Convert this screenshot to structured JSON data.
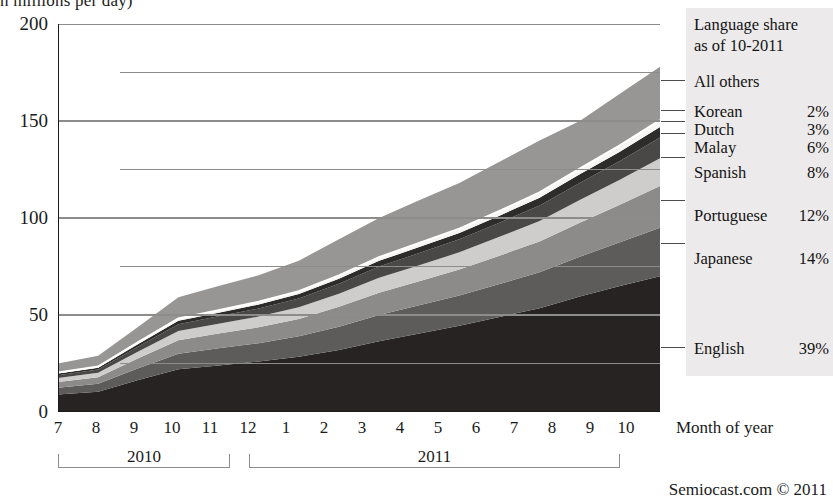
{
  "chart_data": {
    "type": "area",
    "title": "n millions per day)",
    "xlabel": "Month of year",
    "ylabel": "",
    "ylim": [
      0,
      200
    ],
    "yticks": [
      0,
      50,
      100,
      150,
      200
    ],
    "yticks_minor": [
      25,
      75,
      125,
      175
    ],
    "grid": true,
    "legend_position": "right",
    "stacked": true,
    "x": [
      "7",
      "8",
      "9",
      "10",
      "11",
      "12",
      "1",
      "2",
      "3",
      "4",
      "5",
      "6",
      "7",
      "8",
      "9",
      "10"
    ],
    "x_groups": [
      {
        "year": "2010",
        "start_index": 0,
        "end_index": 5
      },
      {
        "year": "2011",
        "start_index": 6,
        "end_index": 15
      }
    ],
    "series": [
      {
        "name": "English",
        "share": "39%",
        "color": "#262322",
        "values": [
          9.0,
          10.5,
          16.5,
          22.0,
          24.0,
          26.0,
          28.5,
          32.0,
          36.5,
          40.5,
          44.5,
          49.0,
          53.5,
          59.5,
          65.0,
          70.0
        ]
      },
      {
        "name": "Japanese",
        "share": "14%",
        "color": "#5e5c5b",
        "values": [
          3.5,
          4.0,
          6.0,
          8.0,
          8.8,
          9.5,
          10.5,
          12.0,
          13.5,
          14.5,
          15.5,
          17.0,
          18.5,
          20.5,
          22.5,
          25.0
        ]
      },
      {
        "name": "Portuguese",
        "share": "12%",
        "color": "#8d8b8a",
        "values": [
          3.0,
          3.4,
          5.2,
          7.0,
          7.6,
          8.2,
          9.0,
          10.2,
          11.5,
          12.4,
          13.4,
          14.6,
          15.9,
          17.6,
          19.3,
          21.5
        ]
      },
      {
        "name": "Spanish",
        "share": "8%",
        "color": "#cfcdcc",
        "values": [
          2.0,
          2.3,
          3.5,
          4.7,
          5.1,
          5.5,
          6.0,
          6.8,
          7.7,
          8.3,
          8.9,
          9.7,
          10.6,
          11.7,
          12.9,
          14.3
        ]
      },
      {
        "name": "Malay",
        "share": "6%",
        "color": "#4a4847",
        "values": [
          1.5,
          1.7,
          2.6,
          3.5,
          3.8,
          4.1,
          4.5,
          5.1,
          5.8,
          6.2,
          6.7,
          7.3,
          8.0,
          8.8,
          9.7,
          10.7
        ]
      },
      {
        "name": "Dutch",
        "share": "3%",
        "color": "#2e2c2b",
        "values": [
          0.8,
          0.9,
          1.3,
          1.8,
          1.9,
          2.1,
          2.3,
          2.6,
          2.9,
          3.1,
          3.3,
          3.6,
          4.0,
          4.4,
          4.8,
          5.4
        ]
      },
      {
        "name": "Korean",
        "share": "2%",
        "color": "#f6f5f4",
        "values": [
          0.5,
          0.6,
          0.9,
          1.2,
          1.3,
          1.4,
          1.5,
          1.7,
          1.9,
          2.1,
          2.2,
          2.4,
          2.7,
          2.9,
          3.2,
          3.6
        ]
      },
      {
        "name": "All others",
        "share": "",
        "color": "#989695",
        "values": [
          4.7,
          5.6,
          8.0,
          11.0,
          12.5,
          13.7,
          15.7,
          18.6,
          20.2,
          22.0,
          23.5,
          25.4,
          26.8,
          24.6,
          26.6,
          27.5
        ]
      }
    ]
  },
  "axes": {
    "y_ticks": [
      "0",
      "50",
      "100",
      "150",
      "200"
    ],
    "x_ticks": [
      "7",
      "8",
      "9",
      "10",
      "11",
      "12",
      "1",
      "2",
      "3",
      "4",
      "5",
      "6",
      "7",
      "8",
      "9",
      "10"
    ],
    "x_axis_title": "Month of year",
    "year_2010": "2010",
    "year_2011": "2011"
  },
  "legend": {
    "title_line1": "Language share",
    "title_line2": "as of 10-2011",
    "entries": [
      {
        "label": "All others",
        "pct": ""
      },
      {
        "label": "Korean",
        "pct": "2%"
      },
      {
        "label": "Dutch",
        "pct": "3%"
      },
      {
        "label": "Malay",
        "pct": "6%"
      },
      {
        "label": "Spanish",
        "pct": "8%"
      },
      {
        "label": "Portuguese",
        "pct": "12%"
      },
      {
        "label": "Japanese",
        "pct": "14%"
      },
      {
        "label": "English",
        "pct": "39%"
      }
    ]
  },
  "credit": "Semiocast.com © 2011",
  "colors": {
    "grid": "#8c8c8c",
    "axis": "#1a1a1a",
    "legend_bg": "#eceaea"
  }
}
